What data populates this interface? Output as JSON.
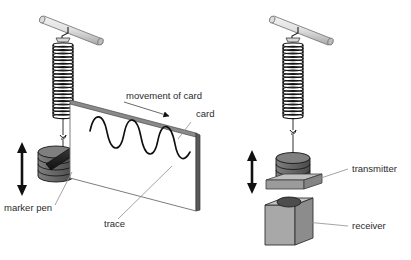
{
  "figure": {
    "background_color": "#ffffff",
    "ink_color": "#1a1a1a",
    "leader_color": "#8d8d8d",
    "label_color": "#2b2b2b"
  },
  "palette": {
    "rod_light": "#e8e8e8",
    "rod_mid": "#cfcfcf",
    "rod_dark": "#9a9a9a",
    "card_face": "#ffffff",
    "card_edge_band": "#8a8a8a",
    "card_side": "#555555",
    "mass_top": "#7d7d7d",
    "mass_body": "#636363",
    "mass_dark": "#3f3f3f",
    "pen_body": "#2e2e2e",
    "pen_tip": "#1a1a1a",
    "plate_top": "#b3b3b3",
    "plate_side": "#8f8f8f",
    "block_front": "#a8a8a8",
    "block_side": "#8a8a8a",
    "block_top": "#c2c2c2",
    "block_hole": "#4a4a4a",
    "arrow_black": "#111111"
  },
  "left_diagram": {
    "name": "card-and-marker-pen-apparatus",
    "labels": [
      {
        "id": "movement-of-card",
        "text": "movement of card",
        "x": 126,
        "y": 99,
        "anchor": "start"
      },
      {
        "id": "card",
        "text": "card",
        "x": 196,
        "y": 117,
        "anchor": "start"
      },
      {
        "id": "marker-pen",
        "text": "marker pen",
        "x": 4,
        "y": 211,
        "anchor": "start"
      },
      {
        "id": "trace",
        "text": "trace",
        "x": 104,
        "y": 227,
        "anchor": "start"
      }
    ],
    "parts": [
      "support-rod",
      "clamp-bracket",
      "spring",
      "hanging-wire",
      "hook",
      "mass-stack",
      "marker-pen",
      "card",
      "wave-trace",
      "movement-arrow",
      "oscillation-arrow"
    ],
    "wave": {
      "cycles": 3,
      "description": "sine wave trace drawn across the card, descending slightly to the right"
    }
  },
  "right_diagram": {
    "name": "transmitter-receiver-apparatus",
    "labels": [
      {
        "id": "transmitter",
        "text": "transmitter",
        "x": 352,
        "y": 172,
        "anchor": "start"
      },
      {
        "id": "receiver",
        "text": "receiver",
        "x": 352,
        "y": 229,
        "anchor": "start"
      }
    ],
    "parts": [
      "support-rod",
      "clamp-bracket",
      "spring",
      "hanging-wire",
      "hook",
      "mass-stack",
      "transmitter-plate",
      "receiver-block",
      "receiver-hole",
      "oscillation-arrow"
    ]
  }
}
